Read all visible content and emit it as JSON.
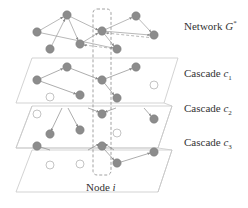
{
  "figure": {
    "type": "multi-layer network diagram",
    "colors": {
      "node_fill": "#8c8c8c",
      "node_stroke": "#7a7a7a",
      "hollow_stroke": "#b5b5b5",
      "edge": "#9a9a9a",
      "plane": "#c8c8c8",
      "dashed_box": "#8a8a8a",
      "text": "#333333"
    },
    "labels": {
      "network": {
        "text": "Network ",
        "var": "G",
        "sup": "*"
      },
      "cascade1": {
        "text": "Cascade ",
        "var": "c",
        "sub": "1"
      },
      "cascade2": {
        "text": "Cascade ",
        "var": "c",
        "sub": "2"
      },
      "cascade3": {
        "text": "Cascade ",
        "var": "c",
        "sub": "3"
      },
      "node": {
        "text": "Node ",
        "var": "i"
      }
    },
    "layers": [
      {
        "name": "network",
        "plane": null,
        "nodes": [
          {
            "id": "A",
            "x": 37,
            "y": 32,
            "active": true
          },
          {
            "id": "B",
            "x": 67,
            "y": 15,
            "active": true
          },
          {
            "id": "C",
            "x": 50,
            "y": 49,
            "active": true
          },
          {
            "id": "D",
            "x": 80,
            "y": 44,
            "active": true
          },
          {
            "id": "E",
            "x": 102,
            "y": 31,
            "active": true
          },
          {
            "id": "F",
            "x": 136,
            "y": 16,
            "active": true
          },
          {
            "id": "G",
            "x": 154,
            "y": 35,
            "active": true
          },
          {
            "id": "H",
            "x": 117,
            "y": 49,
            "active": true
          }
        ],
        "edges": [
          [
            "A",
            "B"
          ],
          [
            "A",
            "H"
          ],
          [
            "C",
            "B"
          ],
          [
            "B",
            "D"
          ],
          [
            "B",
            "E"
          ],
          [
            "D",
            "E"
          ],
          [
            "E",
            "F"
          ],
          [
            "F",
            "G"
          ],
          [
            "E",
            "G"
          ],
          [
            "G",
            "E"
          ],
          [
            "E",
            "H"
          ],
          [
            "H",
            "D"
          ]
        ]
      },
      {
        "name": "cascade1",
        "plane": [
          [
            32,
            58
          ],
          [
            178,
            58
          ],
          [
            164,
            103
          ],
          [
            16,
            103
          ]
        ],
        "nodes": [
          {
            "id": "A",
            "x": 37,
            "y": 80,
            "active": true
          },
          {
            "id": "B",
            "x": 67,
            "y": 67,
            "active": true
          },
          {
            "id": "E",
            "x": 102,
            "y": 80,
            "active": true
          },
          {
            "id": "F",
            "x": 136,
            "y": 67,
            "active": true
          },
          {
            "id": "D",
            "x": 80,
            "y": 95,
            "active": true
          },
          {
            "id": "H",
            "x": 117,
            "y": 98,
            "active": true
          },
          {
            "id": "C",
            "x": 50,
            "y": 97,
            "active": false
          },
          {
            "id": "G",
            "x": 154,
            "y": 85,
            "active": false
          }
        ],
        "edges": [
          [
            "A",
            "B"
          ],
          [
            "A",
            "D"
          ],
          [
            "B",
            "E"
          ],
          [
            "E",
            "F"
          ],
          [
            "E",
            "H"
          ]
        ]
      },
      {
        "name": "cascade2",
        "plane": [
          [
            32,
            106
          ],
          [
            172,
            106
          ],
          [
            158,
            148
          ],
          [
            16,
            148
          ]
        ],
        "nodes": [
          {
            "id": "A",
            "x": 37,
            "y": 114,
            "active": false
          },
          {
            "id": "C",
            "x": 50,
            "y": 134,
            "active": true
          },
          {
            "id": "D",
            "x": 80,
            "y": 130,
            "active": true
          },
          {
            "id": "E",
            "x": 102,
            "y": 114,
            "active": true
          },
          {
            "id": "G",
            "x": 154,
            "y": 119,
            "active": true
          },
          {
            "id": "H",
            "x": 117,
            "y": 133,
            "active": false
          }
        ],
        "edges": [
          [
            "B",
            "C"
          ],
          [
            "B",
            "D"
          ],
          [
            "D",
            "E"
          ],
          [
            "H",
            "E"
          ],
          [
            "F",
            "G"
          ]
        ]
      },
      {
        "name": "cascade3",
        "plane": [
          [
            32,
            150
          ],
          [
            172,
            150
          ],
          [
            158,
            192
          ],
          [
            16,
            192
          ]
        ],
        "nodes": [
          {
            "id": "A",
            "x": 37,
            "y": 146,
            "active": true
          },
          {
            "id": "E",
            "x": 102,
            "y": 146,
            "active": true
          },
          {
            "id": "H",
            "x": 117,
            "y": 163,
            "active": true
          },
          {
            "id": "G",
            "x": 154,
            "y": 152,
            "active": true
          },
          {
            "id": "C",
            "x": 50,
            "y": 165,
            "active": false
          },
          {
            "id": "D",
            "x": 80,
            "y": 164,
            "active": false
          }
        ],
        "edges": [
          [
            "A",
            "Bup"
          ],
          [
            "Dup",
            "E"
          ],
          [
            "Hup",
            "E"
          ],
          [
            "E",
            "H"
          ],
          [
            "H",
            "G"
          ]
        ]
      }
    ],
    "node_i_box": {
      "x": 93,
      "y": 9,
      "w": 18,
      "h": 166,
      "rx": 4
    }
  }
}
